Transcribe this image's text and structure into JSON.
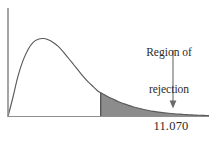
{
  "figure": {
    "name": "chi-square-rejection-region",
    "background_color": "#ffffff",
    "line_color": "#4a4a4a",
    "axis_color": "#8a8a8a",
    "shade_color": "#8c8c8c",
    "shade_border_color": "#3d3d3d",
    "text_color": "#2a2a2a"
  },
  "annotation": {
    "line1": "Region of",
    "line2": "rejection",
    "arrow_name": "annotation-arrow"
  },
  "axis": {
    "critical_value_label": "11.070"
  },
  "chart_data": {
    "type": "area",
    "title": "",
    "subtitle": "",
    "xlabel": "",
    "ylabel": "",
    "grid": false,
    "legend": null,
    "annotations": [
      {
        "text": "Region of rejection",
        "target_x": 11.07,
        "style": "arrow-callout"
      },
      {
        "text": "11.070",
        "axis": "x",
        "type": "tick-label"
      }
    ],
    "distribution": "chi-square",
    "curve_name": "chi-square density",
    "xlim": [
      0,
      24
    ],
    "ylim": [
      0,
      1
    ],
    "critical_value": 11.07,
    "shaded_region": {
      "label": "Region of rejection",
      "from_x": 11.07,
      "to_x": 24,
      "fill": "#8c8c8c"
    },
    "x": [
      0.0,
      0.6,
      1.2,
      1.8,
      2.4,
      3.0,
      3.6,
      4.2,
      4.8,
      5.4,
      6.0,
      6.6,
      7.2,
      7.8,
      8.4,
      9.0,
      9.6,
      10.2,
      10.8,
      11.07,
      11.4,
      12.0,
      12.6,
      13.2,
      13.8,
      14.4,
      15.0,
      15.6,
      16.2,
      16.8,
      17.4,
      18.0,
      18.6,
      19.2,
      19.8,
      20.4,
      21.0,
      21.6,
      22.2,
      22.8,
      23.4,
      24.0
    ],
    "y": [
      0.0,
      0.25,
      0.52,
      0.72,
      0.86,
      0.95,
      0.99,
      1.0,
      0.985,
      0.95,
      0.9,
      0.83,
      0.75,
      0.67,
      0.59,
      0.51,
      0.44,
      0.38,
      0.32,
      0.305,
      0.285,
      0.25,
      0.22,
      0.19,
      0.165,
      0.142,
      0.122,
      0.105,
      0.09,
      0.077,
      0.066,
      0.056,
      0.048,
      0.041,
      0.035,
      0.03,
      0.026,
      0.022,
      0.019,
      0.016,
      0.014,
      0.012
    ]
  }
}
